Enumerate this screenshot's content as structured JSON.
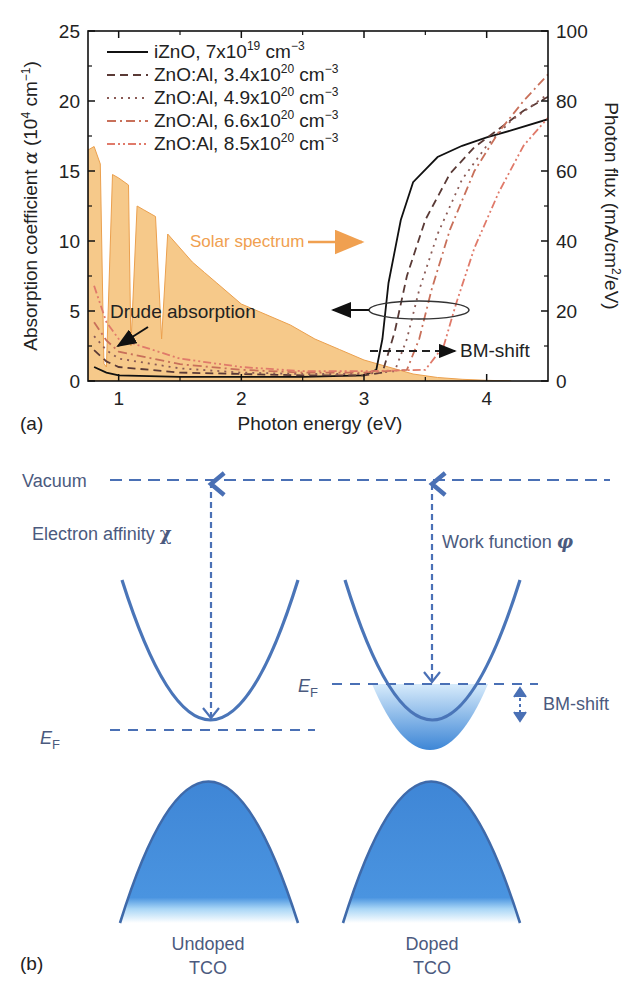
{
  "chart_data": {
    "type": "line",
    "panel_label": "(a)",
    "title": "",
    "xlabel": "Photon energy (eV)",
    "ylabel_left": "Absorption coefficient α (10⁴ cm⁻¹)",
    "ylabel_right": "Photon flux (mA/cm²/eV)",
    "xlim": [
      0.75,
      4.5
    ],
    "ylim_left": [
      0,
      25
    ],
    "ylim_right": [
      0,
      100
    ],
    "xticks": [
      "1",
      "2",
      "3",
      "4"
    ],
    "yticks_left": [
      "0",
      "5",
      "10",
      "15",
      "20",
      "25"
    ],
    "yticks_right": [
      "0",
      "20",
      "40",
      "60",
      "80",
      "100"
    ],
    "grid": false,
    "legend_position": "upper left",
    "legend": [
      {
        "label": "iZnO, 7x10",
        "sup": "19",
        "unit": " cm",
        "unit_sup": "−3",
        "color": "#111111",
        "dash": ""
      },
      {
        "label": "ZnO:Al, 3.4x10",
        "sup": "20",
        "unit": " cm",
        "unit_sup": "−3",
        "color": "#5a3a36",
        "dash": "8,5"
      },
      {
        "label": "ZnO:Al, 4.9x10",
        "sup": "20",
        "unit": " cm",
        "unit_sup": "−3",
        "color": "#8a5a55",
        "dash": "2,5"
      },
      {
        "label": "ZnO:Al, 6.6x10",
        "sup": "20",
        "unit": " cm",
        "unit_sup": "−3",
        "color": "#c8705a",
        "dash": "9,4,2,4"
      },
      {
        "label": "ZnO:Al, 8.5x10",
        "sup": "20",
        "unit": " cm",
        "unit_sup": "−3",
        "color": "#e07a6a",
        "dash": "8,3,2,3,2,3"
      }
    ],
    "series": [
      {
        "name": "iZnO, 7x10^19 cm^-3",
        "axis": "left",
        "x": [
          0.8,
          0.9,
          1.0,
          1.5,
          2.0,
          2.5,
          3.0,
          3.1,
          3.15,
          3.2,
          3.3,
          3.4,
          3.6,
          3.8,
          4.0,
          4.2,
          4.5
        ],
        "y": [
          1.0,
          0.6,
          0.4,
          0.3,
          0.3,
          0.3,
          0.4,
          0.8,
          3.0,
          7.0,
          11.5,
          14.2,
          16.0,
          16.8,
          17.4,
          17.9,
          18.7
        ]
      },
      {
        "name": "ZnO:Al, 3.4x10^20 cm^-3",
        "axis": "left",
        "x": [
          0.8,
          0.9,
          1.0,
          1.5,
          2.0,
          2.5,
          3.0,
          3.15,
          3.25,
          3.35,
          3.5,
          3.7,
          3.9,
          4.1,
          4.3,
          4.5
        ],
        "y": [
          2.2,
          1.4,
          1.0,
          0.6,
          0.5,
          0.4,
          0.4,
          0.6,
          3.5,
          7.5,
          11.5,
          14.8,
          16.7,
          18.0,
          19.3,
          20.3
        ]
      },
      {
        "name": "ZnO:Al, 4.9x10^20 cm^-3",
        "axis": "left",
        "x": [
          0.8,
          0.9,
          1.0,
          1.5,
          2.0,
          2.5,
          3.0,
          3.25,
          3.35,
          3.45,
          3.6,
          3.8,
          4.0,
          4.2,
          4.5
        ],
        "y": [
          3.2,
          2.2,
          1.6,
          0.9,
          0.6,
          0.5,
          0.5,
          0.7,
          3.0,
          6.5,
          10.5,
          14.4,
          16.8,
          18.6,
          20.5
        ]
      },
      {
        "name": "ZnO:Al, 6.6x10^20 cm^-3",
        "axis": "left",
        "x": [
          0.8,
          0.9,
          1.0,
          1.5,
          2.0,
          2.5,
          3.0,
          3.35,
          3.45,
          3.55,
          3.7,
          3.9,
          4.1,
          4.3,
          4.5
        ],
        "y": [
          4.2,
          2.9,
          2.1,
          1.2,
          0.8,
          0.6,
          0.6,
          0.8,
          3.0,
          6.5,
          10.8,
          15.0,
          17.8,
          20.0,
          21.9
        ]
      },
      {
        "name": "ZnO:Al, 8.5x10^20 cm^-3",
        "axis": "left",
        "x": [
          0.8,
          0.9,
          1.0,
          1.5,
          2.0,
          2.5,
          3.0,
          3.5,
          3.65,
          3.75,
          3.9,
          4.1,
          4.3,
          4.5
        ],
        "y": [
          6.8,
          4.2,
          3.0,
          1.6,
          1.0,
          0.7,
          0.7,
          0.8,
          2.5,
          5.5,
          9.5,
          13.5,
          16.8,
          18.8
        ]
      },
      {
        "name": "Solar spectrum",
        "axis": "right",
        "type": "area",
        "color": "#f6c98a",
        "x": [
          0.75,
          0.8,
          0.85,
          0.88,
          0.9,
          0.95,
          1.0,
          1.08,
          1.1,
          1.15,
          1.2,
          1.3,
          1.35,
          1.4,
          1.5,
          1.6,
          1.7,
          1.8,
          2.0,
          2.2,
          2.4,
          2.6,
          2.8,
          3.0,
          3.2,
          3.4,
          3.6,
          3.8,
          4.0,
          4.2
        ],
        "y": [
          66,
          67,
          62,
          5,
          4,
          59,
          58,
          56,
          10,
          50,
          49,
          47,
          12,
          42,
          38,
          34,
          31,
          28,
          22,
          19,
          16,
          12,
          9,
          6,
          4,
          2,
          1,
          0.5,
          0.2,
          0
        ]
      }
    ],
    "annotations": [
      {
        "text": "Solar spectrum",
        "color": "#f0a050",
        "arrow": "right"
      },
      {
        "text": "Drude absorption",
        "arrow": "down-left"
      },
      {
        "text": "BM-shift",
        "arrow": "dashed-right"
      },
      {
        "text": "",
        "type": "ellipse-with-left-arrow",
        "meaning": "curves refer to left axis"
      }
    ]
  },
  "diagram": {
    "panel_label": "(b)",
    "vacuum_label": "Vacuum",
    "electron_affinity_label": "Electron affinity ",
    "electron_affinity_symbol": "χ",
    "work_function_label": "Work function ",
    "work_function_symbol": "φ",
    "fermi_E": "E",
    "fermi_sub": "F",
    "bm_shift_label": "BM-shift",
    "undoped_line1": "Undoped",
    "undoped_line2": "TCO",
    "doped_line1": "Doped",
    "doped_line2": "TCO",
    "colors": {
      "line": "#4a70b5",
      "band_fill": "#4a90dc",
      "text": "#4b5a7e"
    }
  }
}
